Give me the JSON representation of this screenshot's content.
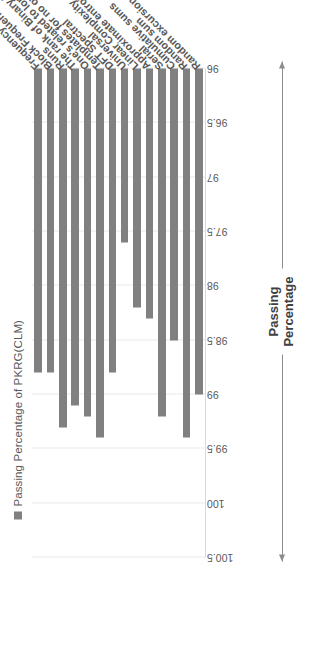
{
  "legend": {
    "marker_color": "#808080",
    "label": "Passing Percentage of PKRG(CLM)"
  },
  "axis_title": {
    "line1": "Passing",
    "line2": "Percentage",
    "text": "Passing\nPercentage"
  },
  "chart_data": {
    "type": "bar",
    "orientation": "horizontal",
    "title": "",
    "subtitle": "",
    "xlabel": "Passing Percentage",
    "ylabel": "",
    "xlim": [
      100.5,
      96
    ],
    "axis_reversed": true,
    "baseline": 96,
    "grid": true,
    "legend_position": "top",
    "bar_color": "#808080",
    "tick_labels": [
      "100.5",
      "100",
      "99.5",
      "99",
      "98.5",
      "98",
      "97.5",
      "97",
      "96.5",
      "96"
    ],
    "ticks": [
      100.5,
      100,
      99.5,
      99,
      98.5,
      98,
      97.5,
      97,
      96.5,
      96
    ],
    "categories": [
      "Frequency",
      "Block Frequency",
      "Runs",
      "The rank of Binary Matrix",
      "One's related to long runs",
      "Templates for no overlapping",
      "DFT Spectral",
      "Universal",
      "Linear Complexity",
      "Approximate entropy",
      "Serial",
      "Cumulative sums",
      "Random sum",
      "Random excursions variant"
    ],
    "series": [
      {
        "name": "Passing Percentage of PKRG(CLM)",
        "values": [
          98.8,
          98.8,
          99.3,
          99.1,
          99.2,
          99.4,
          98.8,
          97.6,
          98.2,
          98.3,
          99.2,
          98.5,
          99.4,
          99.0
        ]
      }
    ]
  }
}
